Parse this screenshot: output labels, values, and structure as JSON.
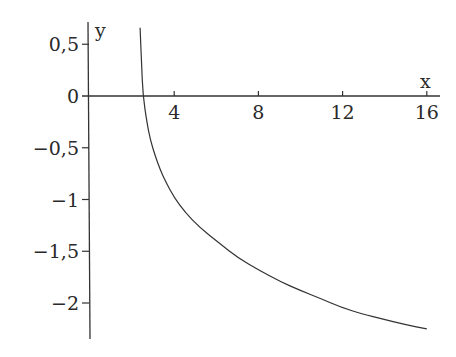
{
  "chart_data": {
    "type": "line",
    "title": "",
    "xlabel": "x",
    "ylabel": "y",
    "xlim": [
      0,
      16.5
    ],
    "ylim": [
      -2.35,
      0.72
    ],
    "grid": false,
    "x_ticks": [
      {
        "value": 4,
        "label": "4"
      },
      {
        "value": 8,
        "label": "8"
      },
      {
        "value": 12,
        "label": "12"
      },
      {
        "value": 16,
        "label": "16"
      }
    ],
    "y_ticks": [
      {
        "value": 0.5,
        "label": "0,5"
      },
      {
        "value": 0,
        "label": "0"
      },
      {
        "value": -0.5,
        "label": "−0,5"
      },
      {
        "value": -1,
        "label": "−1"
      },
      {
        "value": -1.5,
        "label": "−1,5"
      },
      {
        "value": -2,
        "label": "−2"
      }
    ],
    "series": [
      {
        "name": "curve",
        "x": [
          2.38,
          2.45,
          2.52,
          2.7,
          2.86,
          3.1,
          3.33,
          3.6,
          4.0,
          4.5,
          5.2,
          6.2,
          7.0,
          8.1,
          9.0,
          10.0,
          11.0,
          11.9,
          13.0,
          13.8,
          15.0,
          16.0
        ],
        "y": [
          0.66,
          0.3,
          0.0,
          -0.25,
          -0.42,
          -0.58,
          -0.71,
          -0.83,
          -0.98,
          -1.12,
          -1.27,
          -1.43,
          -1.56,
          -1.69,
          -1.79,
          -1.88,
          -1.96,
          -2.04,
          -2.11,
          -2.15,
          -2.21,
          -2.25
        ]
      }
    ]
  }
}
